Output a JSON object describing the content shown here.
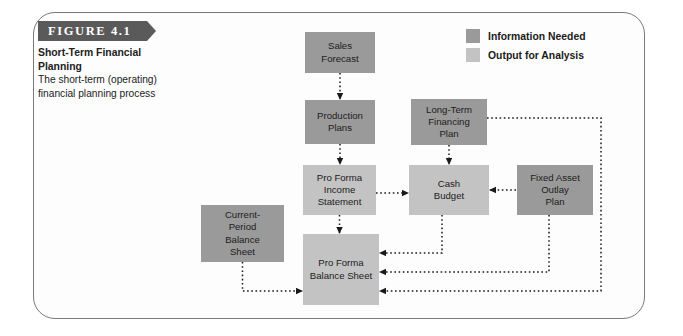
{
  "figure": {
    "banner_label": "FIGURE 4.1",
    "title_line1": "Short-Term Financial",
    "title_line2": "Planning",
    "subtitle_line1": "The short-term (operating)",
    "subtitle_line2": "financial planning process"
  },
  "colors": {
    "information_needed": "#9a9a9a",
    "output_for_analysis": "#c3c3c3",
    "banner": "#5a5a5a",
    "frame": "#7a7a7a",
    "wire": "#1a1a1a",
    "text": "#1c1c1c"
  },
  "legend": {
    "items": [
      {
        "label": "Information Needed",
        "color": "#9a9a9a",
        "kind": "information_needed"
      },
      {
        "label": "Output for Analysis",
        "color": "#c3c3c3",
        "kind": "output_for_analysis"
      }
    ]
  },
  "chart_data": {
    "type": "diagram",
    "title": "Short-Term Financial Planning",
    "subtitle": "The short-term (operating) financial planning process",
    "nodes": [
      {
        "id": "sales_forecast",
        "label": "Sales\nForecast",
        "kind": "information_needed",
        "x": 305,
        "y": 32,
        "w": 70,
        "h": 41
      },
      {
        "id": "production_plans",
        "label": "Production\nPlans",
        "kind": "information_needed",
        "x": 305,
        "y": 100,
        "w": 70,
        "h": 44
      },
      {
        "id": "pro_forma_income",
        "label": "Pro Forma\nIncome\nStatement",
        "kind": "output_for_analysis",
        "x": 303,
        "y": 165,
        "w": 73,
        "h": 50
      },
      {
        "id": "long_term_fin",
        "label": "Long-Term\nFinancing\nPlan",
        "kind": "information_needed",
        "x": 411,
        "y": 99,
        "w": 76,
        "h": 46
      },
      {
        "id": "cash_budget",
        "label": "Cash\nBudget",
        "kind": "output_for_analysis",
        "x": 409,
        "y": 165,
        "w": 80,
        "h": 50
      },
      {
        "id": "fixed_asset",
        "label": "Fixed Asset\nOutlay\nPlan",
        "kind": "information_needed",
        "x": 517,
        "y": 165,
        "w": 76,
        "h": 50
      },
      {
        "id": "current_period_bs",
        "label": "Current-\nPeriod\nBalance\nSheet",
        "kind": "information_needed",
        "x": 201,
        "y": 205,
        "w": 83,
        "h": 57
      },
      {
        "id": "pro_forma_bs",
        "label": "Pro Forma\nBalance Sheet",
        "kind": "output_for_analysis",
        "x": 303,
        "y": 234,
        "w": 76,
        "h": 71
      }
    ],
    "edges": [
      {
        "from": "sales_forecast",
        "to": "production_plans"
      },
      {
        "from": "production_plans",
        "to": "pro_forma_income"
      },
      {
        "from": "pro_forma_income",
        "to": "cash_budget"
      },
      {
        "from": "pro_forma_income",
        "to": "pro_forma_bs"
      },
      {
        "from": "long_term_fin",
        "to": "cash_budget"
      },
      {
        "from": "long_term_fin",
        "to": "pro_forma_bs"
      },
      {
        "from": "fixed_asset",
        "to": "cash_budget"
      },
      {
        "from": "fixed_asset",
        "to": "pro_forma_bs"
      },
      {
        "from": "cash_budget",
        "to": "pro_forma_bs"
      },
      {
        "from": "current_period_bs",
        "to": "pro_forma_bs"
      }
    ]
  }
}
